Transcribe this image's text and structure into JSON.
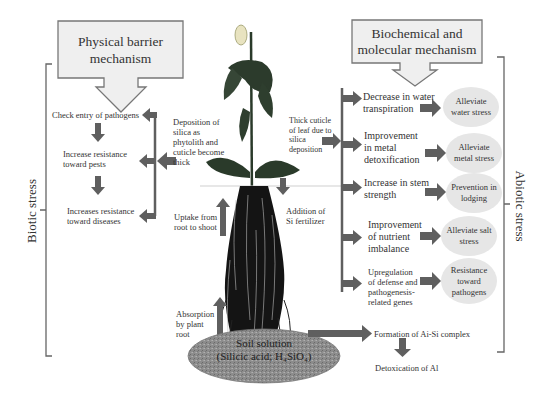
{
  "colors": {
    "arrow": "#5f5f5f",
    "callout_fill": "#efefef",
    "callout_border": "#777777",
    "oval_fill": "#e6e6e6",
    "soil_fill": "#8a8a8a",
    "bracket": "#666666"
  },
  "callouts": {
    "physical": "Physical barrier mechanism",
    "biochemical": "Biochemical and molecular mechanism"
  },
  "side_labels": {
    "biotic": "Biotic stress",
    "abiotic": "Abiotic stress"
  },
  "biotic_chain": [
    "Check entry of pathogens",
    "Increase resistance toward pests",
    "Increases resistance toward diseases"
  ],
  "plant_labels": {
    "deposition": "Deposition of silica as phytolith and cuticle become thick",
    "uptake": "Uptake from root to shoot",
    "absorption": "Absorption by plant root",
    "addition": "Addition of Si fertilizer",
    "thick_cuticle": "Thick cuticle of leaf due to silica deposition"
  },
  "abiotic_rows": [
    {
      "effect": "Decrease in water transpiration",
      "result": "Alleviate water stress"
    },
    {
      "effect": "Improvement in metal detoxification",
      "result": "Alleviate metal stress"
    },
    {
      "effect": "Increase in stem strength",
      "result": "Prevention in lodging"
    },
    {
      "effect": "Improvement of nutrient imbalance",
      "result": "Alleviate salt stress"
    },
    {
      "effect": "Upregulation of defense and pathogenesis-related genes",
      "result": "Resistance toward pathogens"
    }
  ],
  "soil": {
    "line1": "Soil solution",
    "line2": "(Silicic acid; H₄SiO₄)"
  },
  "aluminum": {
    "formation": "Formation of Ai-Si complex",
    "detox": "Detoxication of Al"
  }
}
